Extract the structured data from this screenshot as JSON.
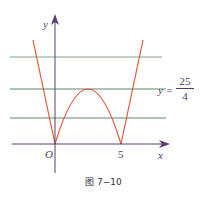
{
  "figure": {
    "caption": "图 7−10",
    "function": "y = |x^2 - 5x|",
    "axes": {
      "x_label": "x",
      "y_label": "y",
      "origin_label": "O"
    },
    "x_ticks": [
      {
        "value": 5,
        "label": "5"
      }
    ],
    "horizontal_lines": [
      {
        "role": "above-peak"
      },
      {
        "role": "peak",
        "label_lhs": "y =",
        "label_num": "25",
        "label_den": "4"
      },
      {
        "role": "below-peak"
      }
    ],
    "colors": {
      "curve": "#e05a3a",
      "axes": "#5b3f6e",
      "lines": "#5a8a6a",
      "text": "#4a3b6a"
    }
  }
}
